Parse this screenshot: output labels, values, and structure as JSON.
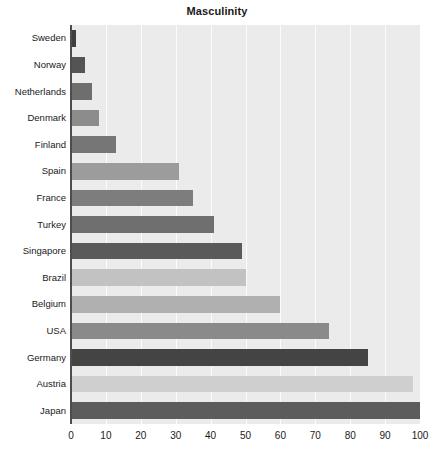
{
  "chart_data": {
    "type": "bar",
    "orientation": "horizontal",
    "title": "Masculinity",
    "xlabel": "",
    "ylabel": "",
    "xlim": [
      0,
      100
    ],
    "xticks": [
      0,
      10,
      20,
      30,
      40,
      50,
      60,
      70,
      80,
      90,
      100
    ],
    "grid": true,
    "legend": "none",
    "categories": [
      "Sweden",
      "Norway",
      "Netherlands",
      "Denmark",
      "Finland",
      "Spain",
      "France",
      "Turkey",
      "Singapore",
      "Brazil",
      "Belgium",
      "USA",
      "Germany",
      "Austria",
      "Japan"
    ],
    "values": [
      5,
      8,
      14,
      16,
      26,
      42,
      43,
      45,
      48,
      49,
      54,
      62,
      66,
      79,
      95
    ],
    "bar_colors": [
      "#3f3f3f",
      "#545454",
      "#6e6e6e",
      "#8c8c8c",
      "#767676",
      "#9c9c9c",
      "#7d7d7d",
      "#6f6f6f",
      "#5a5a5a",
      "#c2c2c2",
      "#b0b0b0",
      "#8a8a8a",
      "#444444",
      "#cfcfcf",
      "#5c5c5c"
    ],
    "bar_lengths_units": [
      1.5,
      4,
      6,
      8,
      13,
      31,
      35,
      41,
      49,
      50,
      60,
      74,
      85,
      98,
      100
    ],
    "plot_background": "#ebebeb",
    "gridline_color": "#ffffff",
    "axis_color": "#4d4d4d",
    "text_color": "#1a1a1a"
  }
}
